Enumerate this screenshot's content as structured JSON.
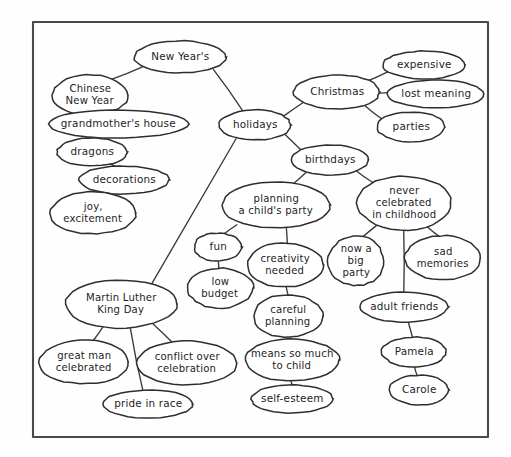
{
  "document": {
    "title": "Holidays concept map",
    "style": "hand-drawn ink on paper",
    "border_color": "#4a4a4a",
    "ink_color": "#2e2e2e",
    "paper_color": "#fefefe"
  },
  "frame": {
    "x": 33,
    "y": 22,
    "width": 455,
    "height": 415
  },
  "nodes": [
    {
      "id": "new_years",
      "label": "New Year's",
      "lines": [
        "New Year's"
      ],
      "cx": 180,
      "cy": 57,
      "rx": 46,
      "ry": 16
    },
    {
      "id": "chinese_new_year",
      "label": "Chinese New Year",
      "lines": [
        "Chinese",
        "New Year"
      ],
      "cx": 90,
      "cy": 95,
      "rx": 38,
      "ry": 20
    },
    {
      "id": "grandmothers",
      "label": "grandmother's house",
      "lines": [
        "grandmother's house"
      ],
      "cx": 118,
      "cy": 124,
      "rx": 70,
      "ry": 14
    },
    {
      "id": "dragons",
      "label": "dragons",
      "lines": [
        "dragons"
      ],
      "cx": 92,
      "cy": 152,
      "rx": 35,
      "ry": 14
    },
    {
      "id": "decorations",
      "label": "decorations",
      "lines": [
        "decorations"
      ],
      "cx": 124,
      "cy": 180,
      "rx": 45,
      "ry": 14
    },
    {
      "id": "joy_excitement",
      "label": "joy, excitement",
      "lines": [
        "joy,",
        "excitement"
      ],
      "cx": 93,
      "cy": 213,
      "rx": 43,
      "ry": 21
    },
    {
      "id": "holidays",
      "label": "holidays",
      "lines": [
        "holidays"
      ],
      "cx": 255,
      "cy": 125,
      "rx": 36,
      "ry": 15
    },
    {
      "id": "christmas",
      "label": "Christmas",
      "lines": [
        "Christmas"
      ],
      "cx": 337,
      "cy": 92,
      "rx": 43,
      "ry": 17
    },
    {
      "id": "expensive",
      "label": "expensive",
      "lines": [
        "expensive"
      ],
      "cx": 424,
      "cy": 65,
      "rx": 41,
      "ry": 14
    },
    {
      "id": "lost_meaning",
      "label": "lost meaning",
      "lines": [
        "lost meaning"
      ],
      "cx": 436,
      "cy": 94,
      "rx": 48,
      "ry": 14
    },
    {
      "id": "parties",
      "label": "parties",
      "lines": [
        "parties"
      ],
      "cx": 411,
      "cy": 127,
      "rx": 34,
      "ry": 15
    },
    {
      "id": "birthdays",
      "label": "birthdays",
      "lines": [
        "birthdays"
      ],
      "cx": 330,
      "cy": 160,
      "rx": 39,
      "ry": 15
    },
    {
      "id": "planning_party",
      "label": "planning a child's party",
      "lines": [
        "planning",
        "a child's party"
      ],
      "cx": 276,
      "cy": 205,
      "rx": 54,
      "ry": 23
    },
    {
      "id": "never_celebrated",
      "label": "never celebrated in childhood",
      "lines": [
        "never",
        "celebrated",
        "in childhood"
      ],
      "cx": 404,
      "cy": 203,
      "rx": 47,
      "ry": 27
    },
    {
      "id": "fun",
      "label": "fun",
      "lines": [
        "fun"
      ],
      "cx": 218,
      "cy": 247,
      "rx": 24,
      "ry": 14
    },
    {
      "id": "low_budget",
      "label": "low budget",
      "lines": [
        "low",
        "budget"
      ],
      "cx": 220,
      "cy": 288,
      "rx": 33,
      "ry": 20
    },
    {
      "id": "creativity",
      "label": "creativity needed",
      "lines": [
        "creativity",
        "needed"
      ],
      "cx": 285,
      "cy": 265,
      "rx": 38,
      "ry": 22
    },
    {
      "id": "careful_planning",
      "label": "careful planning",
      "lines": [
        "careful",
        "planning"
      ],
      "cx": 288,
      "cy": 316,
      "rx": 35,
      "ry": 21
    },
    {
      "id": "means_so_much",
      "label": "means so much to child",
      "lines": [
        "means so much",
        "to child"
      ],
      "cx": 292,
      "cy": 360,
      "rx": 47,
      "ry": 21
    },
    {
      "id": "self_esteem",
      "label": "self-esteem",
      "lines": [
        "self-esteem"
      ],
      "cx": 292,
      "cy": 399,
      "rx": 41,
      "ry": 14
    },
    {
      "id": "now_big_party",
      "label": "now a big party",
      "lines": [
        "now a",
        "big",
        "party"
      ],
      "cx": 356,
      "cy": 261,
      "rx": 28,
      "ry": 25
    },
    {
      "id": "sad_memories",
      "label": "sad memories",
      "lines": [
        "sad",
        "memories"
      ],
      "cx": 443,
      "cy": 258,
      "rx": 38,
      "ry": 22
    },
    {
      "id": "adult_friends",
      "label": "adult friends",
      "lines": [
        "adult friends"
      ],
      "cx": 404,
      "cy": 307,
      "rx": 44,
      "ry": 15
    },
    {
      "id": "pamela",
      "label": "Pamela",
      "lines": [
        "Pamela"
      ],
      "cx": 414,
      "cy": 352,
      "rx": 32,
      "ry": 15
    },
    {
      "id": "carole",
      "label": "Carole",
      "lines": [
        "Carole"
      ],
      "cx": 419,
      "cy": 390,
      "rx": 30,
      "ry": 15
    },
    {
      "id": "mlk_day",
      "label": "Martin Luther King Day",
      "lines": [
        "Martin Luther",
        "King Day"
      ],
      "cx": 121,
      "cy": 304,
      "rx": 56,
      "ry": 24
    },
    {
      "id": "great_man",
      "label": "great man celebrated",
      "lines": [
        "great man",
        "celebrated"
      ],
      "cx": 84,
      "cy": 362,
      "rx": 45,
      "ry": 22
    },
    {
      "id": "conflict_over",
      "label": "conflict over celebration",
      "lines": [
        "conflict over",
        "celebration"
      ],
      "cx": 187,
      "cy": 363,
      "rx": 50,
      "ry": 22
    },
    {
      "id": "pride_in_race",
      "label": "pride in race",
      "lines": [
        "pride in race"
      ],
      "cx": 148,
      "cy": 404,
      "rx": 45,
      "ry": 14
    }
  ],
  "edges": [
    {
      "from": "new_years",
      "to": "chinese_new_year",
      "x1": 143,
      "y1": 67,
      "x2": 111,
      "y2": 79
    },
    {
      "from": "new_years",
      "to": "holidays",
      "x1": 213,
      "y1": 69,
      "x2": 243,
      "y2": 111
    },
    {
      "from": "chinese_new_year",
      "to": "grandmothers",
      "x1": 92,
      "y1": 115,
      "x2": 95,
      "y2": 112
    },
    {
      "from": "grandmothers",
      "to": "dragons",
      "x1": 88,
      "y1": 137,
      "x2": 86,
      "y2": 139
    },
    {
      "from": "dragons",
      "to": "decorations",
      "x1": 111,
      "y1": 164,
      "x2": 116,
      "y2": 167
    },
    {
      "from": "decorations",
      "to": "joy_excitement",
      "x1": 107,
      "y1": 193,
      "x2": 100,
      "y2": 193
    },
    {
      "from": "holidays",
      "to": "christmas",
      "x1": 285,
      "y1": 115,
      "x2": 305,
      "y2": 101
    },
    {
      "from": "holidays",
      "to": "birthdays",
      "x1": 284,
      "y1": 134,
      "x2": 303,
      "y2": 151
    },
    {
      "from": "holidays",
      "to": "mlk_day",
      "x1": 236,
      "y1": 139,
      "x2": 152,
      "y2": 284
    },
    {
      "from": "christmas",
      "to": "expensive",
      "x1": 366,
      "y1": 82,
      "x2": 388,
      "y2": 71
    },
    {
      "from": "christmas",
      "to": "lost_meaning",
      "x1": 380,
      "y1": 93,
      "x2": 389,
      "y2": 93
    },
    {
      "from": "christmas",
      "to": "parties",
      "x1": 364,
      "y1": 105,
      "x2": 382,
      "y2": 119
    },
    {
      "from": "birthdays",
      "to": "planning_party",
      "x1": 306,
      "y1": 172,
      "x2": 293,
      "y2": 184
    },
    {
      "from": "birthdays",
      "to": "never_celebrated",
      "x1": 355,
      "y1": 170,
      "x2": 373,
      "y2": 183
    },
    {
      "from": "planning_party",
      "to": "fun",
      "x1": 237,
      "y1": 224,
      "x2": 224,
      "y2": 234
    },
    {
      "from": "planning_party",
      "to": "creativity",
      "x1": 286,
      "y1": 228,
      "x2": 287,
      "y2": 244
    },
    {
      "from": "fun",
      "to": "low_budget",
      "x1": 218,
      "y1": 261,
      "x2": 219,
      "y2": 269
    },
    {
      "from": "creativity",
      "to": "careful_planning",
      "x1": 286,
      "y1": 287,
      "x2": 288,
      "y2": 296
    },
    {
      "from": "careful_planning",
      "to": "means_so_much",
      "x1": 290,
      "y1": 337,
      "x2": 291,
      "y2": 340
    },
    {
      "from": "means_so_much",
      "to": "self_esteem",
      "x1": 291,
      "y1": 381,
      "x2": 292,
      "y2": 386
    },
    {
      "from": "never_celebrated",
      "to": "now_big_party",
      "x1": 376,
      "y1": 226,
      "x2": 362,
      "y2": 237
    },
    {
      "from": "never_celebrated",
      "to": "sad_memories",
      "x1": 428,
      "y1": 227,
      "x2": 439,
      "y2": 237
    },
    {
      "from": "never_celebrated",
      "to": "adult_friends",
      "x1": 404,
      "y1": 230,
      "x2": 404,
      "y2": 292
    },
    {
      "from": "adult_friends",
      "to": "pamela",
      "x1": 408,
      "y1": 322,
      "x2": 413,
      "y2": 338
    },
    {
      "from": "pamela",
      "to": "carole",
      "x1": 414,
      "y1": 367,
      "x2": 417,
      "y2": 376
    },
    {
      "from": "mlk_day",
      "to": "great_man",
      "x1": 103,
      "y1": 327,
      "x2": 93,
      "y2": 341
    },
    {
      "from": "mlk_day",
      "to": "conflict_over",
      "x1": 152,
      "y1": 323,
      "x2": 172,
      "y2": 342
    },
    {
      "from": "mlk_day",
      "to": "pride_in_race",
      "x1": 131,
      "y1": 328,
      "x2": 143,
      "y2": 390
    }
  ]
}
